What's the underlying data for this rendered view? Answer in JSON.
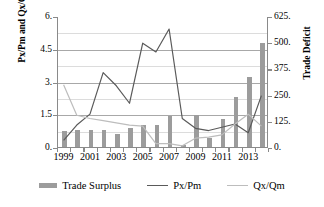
{
  "chart_data": {
    "type": "bar",
    "title": "",
    "xlabel": "",
    "ylabel": "Px/Pm and Qx/Qm",
    "ylabel_secondary": "Trade Deficit",
    "grid": true,
    "legend_position": "bottom",
    "ylim": [
      0,
      6
    ],
    "ylim_secondary": [
      0,
      625
    ],
    "yticks": [
      "0.",
      "1.5",
      "3.",
      "4.5",
      "6."
    ],
    "yticks_secondary": [
      "0.",
      "125.",
      "250.",
      "375.",
      "500.",
      "625."
    ],
    "categories": [
      1999,
      2000,
      2001,
      2002,
      2003,
      2004,
      2005,
      2006,
      2007,
      2008,
      2009,
      2010,
      2011,
      2012,
      2013,
      2014
    ],
    "xtick_labels": [
      "1999",
      "2001",
      "2003",
      "2005",
      "2007",
      "2009",
      "2011",
      "2013"
    ],
    "series": [
      {
        "name": "Trade Surplus",
        "type": "bar",
        "axis": "secondary",
        "color": "#9c9c9c",
        "values": [
          75,
          80,
          80,
          80,
          62,
          90,
          105,
          105,
          150,
          10,
          152,
          45,
          132,
          238,
          333,
          495
        ]
      },
      {
        "name": "Px/Pm",
        "type": "line",
        "axis": "primary",
        "color": "#5a5a5a",
        "values": [
          0.35,
          1.05,
          1.55,
          3.45,
          2.85,
          2.05,
          4.8,
          4.4,
          5.45,
          1.35,
          0.9,
          0.8,
          0.95,
          1.1,
          0.7,
          2.4
        ]
      },
      {
        "name": "Qx/Qm",
        "type": "line",
        "axis": "primary",
        "color": "#bdbdbd",
        "values": [
          2.9,
          1.5,
          1.35,
          1.25,
          1.15,
          1.05,
          1.0,
          0.2,
          0.2,
          0.1,
          0.45,
          0.5,
          0.6,
          1.1,
          1.55,
          1.0
        ]
      }
    ]
  },
  "legend": {
    "items": [
      {
        "label": "Trade Surplus"
      },
      {
        "label": "Px/Pm"
      },
      {
        "label": "Qx/Qm"
      }
    ]
  }
}
